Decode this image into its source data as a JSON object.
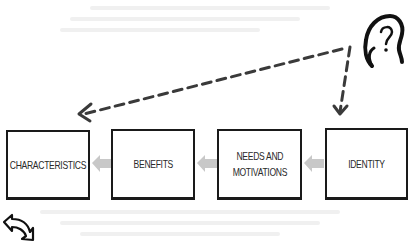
{
  "diagram": {
    "boxes": [
      {
        "id": "characteristics",
        "label": "CHARACTERISTICS",
        "x": 6,
        "y": 130,
        "w": 84,
        "h": 70
      },
      {
        "id": "benefits",
        "label": "BENEFITS",
        "x": 111,
        "y": 129,
        "w": 84,
        "h": 71
      },
      {
        "id": "needs-and-motivations",
        "label": "NEEDS AND\nMOTIVATIONS",
        "x": 217,
        "y": 129,
        "w": 85,
        "h": 71
      },
      {
        "id": "identity",
        "label": "IDENTITY",
        "x": 325,
        "y": 128,
        "w": 83,
        "h": 72
      }
    ],
    "flow": [
      "IDENTITY",
      "NEEDS AND MOTIVATIONS",
      "BENEFITS",
      "CHARACTERISTICS"
    ],
    "flow_arrow_color": "#c8c8c8",
    "dashed_arrow_color": "#333333",
    "icons": {
      "top_right": "head-question-mark-icon",
      "bottom_left": "curved-arrow-icon"
    }
  }
}
